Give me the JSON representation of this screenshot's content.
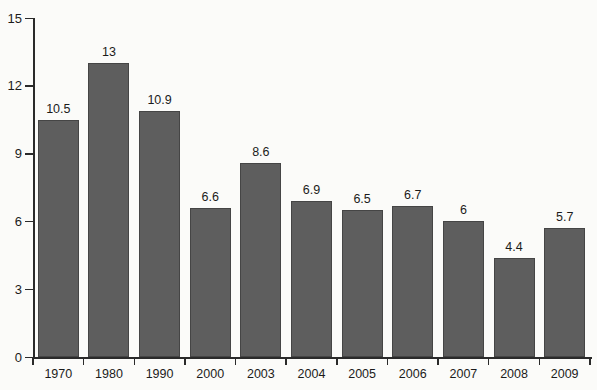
{
  "chart_data": {
    "type": "bar",
    "title": "",
    "xlabel": "",
    "ylabel": "",
    "categories": [
      "1970",
      "1980",
      "1990",
      "2000",
      "2003",
      "2004",
      "2005",
      "2006",
      "2007",
      "2008",
      "2009"
    ],
    "values": [
      10.5,
      13,
      10.9,
      6.6,
      8.6,
      6.9,
      6.5,
      6.7,
      6,
      4.4,
      5.7
    ],
    "value_labels": [
      "10.5",
      "13",
      "10.9",
      "6.6",
      "8.6",
      "6.9",
      "6.5",
      "6.7",
      "6",
      "4.4",
      "5.7"
    ],
    "ylim": [
      0,
      15
    ],
    "yticks": [
      0,
      3,
      6,
      9,
      12,
      15
    ],
    "ytick_labels": [
      "0",
      "3",
      "6",
      "9",
      "12",
      "15"
    ],
    "grid": false,
    "legend": null,
    "colors": {
      "bar_fill": "#5e5e5e",
      "bar_border": "#454545",
      "axis": "#2a2a2a",
      "text": "#1b1b1b",
      "background": "#fbfbf9"
    }
  }
}
